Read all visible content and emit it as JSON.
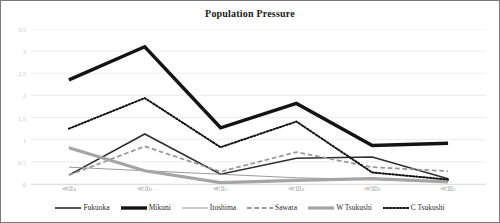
{
  "chart": {
    "title": "Population Pressure"
  },
  "chart_data": {
    "type": "line",
    "title": "Population Pressure",
    "xlabel": "",
    "ylabel": "",
    "ylim": [
      0,
      3.5
    ],
    "yticks": [
      "0",
      "0.5",
      "1",
      "1.5",
      "2",
      "2.5",
      "3",
      "3.5"
    ],
    "ytick_values": [
      0,
      0.5,
      1,
      1.5,
      2,
      2.5,
      3,
      3.5
    ],
    "grid": true,
    "legend_position": "bottom",
    "categories": [
      "≪Ⅱa",
      "≪Ⅱb",
      "≪Ⅱc",
      "≪Ⅲa",
      "≪Ⅲb",
      "≪Ⅲc"
    ],
    "series": [
      {
        "name": "Fukuoka",
        "values": [
          0.2,
          1.13,
          0.22,
          0.58,
          0.61,
          0.12
        ],
        "color": "#2e2e2e",
        "style": "solid",
        "width": 1.6
      },
      {
        "name": "Mikuni",
        "values": [
          2.35,
          3.1,
          1.27,
          1.82,
          0.87,
          0.92
        ],
        "color": "#141414",
        "style": "solid",
        "width": 3.4
      },
      {
        "name": "Itoshima",
        "values": [
          0.38,
          0.3,
          0.22,
          0.14,
          0.1,
          0.05
        ],
        "color": "#9a9a9a",
        "style": "solid",
        "width": 1.0
      },
      {
        "name": "Sawara",
        "values": [
          0.2,
          0.85,
          0.28,
          0.72,
          0.38,
          0.29
        ],
        "color": "#9a9a9a",
        "style": "dashed",
        "width": 1.8
      },
      {
        "name": "W Tsukushi",
        "values": [
          0.82,
          0.3,
          0.03,
          0.08,
          0.12,
          0.05
        ],
        "color": "#a5a5a5",
        "style": "solid",
        "width": 3.2
      },
      {
        "name": "C Tsukushi",
        "values": [
          1.25,
          1.94,
          0.83,
          1.41,
          0.26,
          0.1
        ],
        "color": "#111111",
        "style": "dotted",
        "width": 2.0
      }
    ]
  }
}
